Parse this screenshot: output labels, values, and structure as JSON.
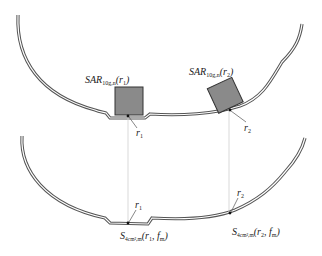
{
  "diagram": {
    "top_panel": {
      "label_box1": {
        "main": "SAR",
        "sub": "10g,n",
        "arg": "(r",
        "arg_sub": "1",
        "close": ")"
      },
      "label_box2": {
        "main": "SAR",
        "sub": "10g,n",
        "arg": "(r",
        "arg_sub": "2",
        "close": ")"
      },
      "point1": {
        "main": "r",
        "sub": "1"
      },
      "point2": {
        "main": "r",
        "sub": "2"
      }
    },
    "bottom_panel": {
      "point1": {
        "main": "r",
        "sub": "1"
      },
      "point2": {
        "main": "r",
        "sub": "2"
      },
      "label_s1": {
        "main": "S",
        "sub": "4cm²,m",
        "arg": "(r",
        "arg_sub": "1",
        "mid": ", f",
        "mid_sub": "m",
        "close": ")"
      },
      "label_s2": {
        "main": "S",
        "sub": "4cm²,m",
        "arg": "(r",
        "arg_sub": "2",
        "mid": ", f",
        "mid_sub": "m",
        "close": ")"
      }
    },
    "colors": {
      "outline": "#555555",
      "box_fill": "#8a8a8a",
      "box_stroke": "#333333",
      "guide_line": "#cfcfcf"
    }
  }
}
